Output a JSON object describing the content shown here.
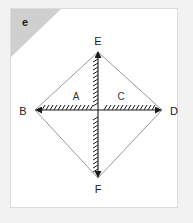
{
  "page": {
    "background_color": "#f2f2f2",
    "card_background_color": "#ffffff",
    "card_border_color": "#dcdcdc"
  },
  "corner_tag": {
    "label": "e",
    "fold_color": "#cfcfcf"
  },
  "figure": {
    "type": "geometry-diagram",
    "outline_color": "#9a9a9a",
    "diagonal_color": "#1c1c1c",
    "vertices": [
      {
        "name": "E",
        "label": "E",
        "x": 98,
        "y": 52,
        "label_x": 98,
        "label_y": 41
      },
      {
        "name": "B",
        "label": "B",
        "x": 35,
        "y": 110,
        "label_x": 22,
        "label_y": 114
      },
      {
        "name": "D",
        "label": "D",
        "x": 162,
        "y": 110,
        "label_x": 174,
        "label_y": 114
      },
      {
        "name": "F",
        "label": "F",
        "x": 98,
        "y": 178,
        "label_x": 98,
        "label_y": 192
      }
    ],
    "edges": [
      {
        "name": "edge-BE",
        "from": "B",
        "to": "E"
      },
      {
        "name": "edge-ED",
        "from": "E",
        "to": "D"
      },
      {
        "name": "edge-DF",
        "from": "D",
        "to": "F"
      },
      {
        "name": "edge-FB",
        "from": "F",
        "to": "B"
      }
    ],
    "diagonals": [
      {
        "name": "diagonal-BD",
        "from": "B",
        "to": "D",
        "style": "hatched-double-arrow"
      },
      {
        "name": "diagonal-EF",
        "from": "E",
        "to": "F",
        "style": "hatched-double-arrow"
      }
    ],
    "region_labels": [
      {
        "name": "A",
        "label": "A",
        "x": 76,
        "y": 97
      },
      {
        "name": "C",
        "label": "C",
        "x": 120,
        "y": 97
      }
    ]
  }
}
